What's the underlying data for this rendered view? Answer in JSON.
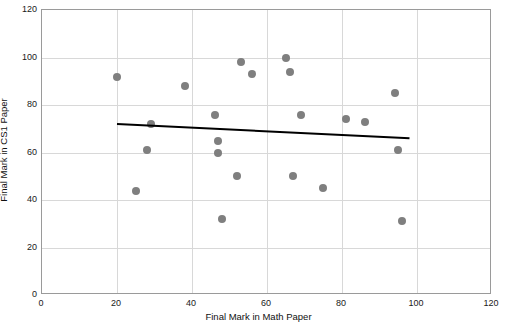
{
  "chart_data": {
    "type": "scatter",
    "title": "",
    "xlabel": "Final Mark in Math Paper",
    "ylabel": "Final Mark in CS1 Paper",
    "xlim": [
      0,
      120
    ],
    "ylim": [
      0,
      120
    ],
    "xticks": [
      0,
      20,
      40,
      60,
      80,
      100,
      120
    ],
    "yticks": [
      0,
      20,
      40,
      60,
      80,
      100,
      120
    ],
    "grid": true,
    "legend": "none",
    "point_color": "#7f7f7f",
    "trendline_color": "#000000",
    "series": [
      {
        "name": "Students",
        "points": [
          [
            20,
            92
          ],
          [
            25,
            44
          ],
          [
            28,
            61
          ],
          [
            29,
            72
          ],
          [
            38,
            88
          ],
          [
            46,
            76
          ],
          [
            47,
            60
          ],
          [
            47,
            65
          ],
          [
            48,
            32
          ],
          [
            52,
            50
          ],
          [
            53,
            98
          ],
          [
            56,
            93
          ],
          [
            65,
            100
          ],
          [
            66,
            94
          ],
          [
            67,
            50
          ],
          [
            69,
            76
          ],
          [
            75,
            45
          ],
          [
            81,
            74
          ],
          [
            86,
            73
          ],
          [
            94,
            85
          ],
          [
            95,
            61
          ],
          [
            96,
            31
          ]
        ]
      }
    ],
    "trendline": {
      "x_start": 20,
      "y_start": 72,
      "x_end": 98,
      "y_end": 66
    }
  }
}
